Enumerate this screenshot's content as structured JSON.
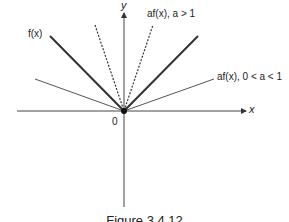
{
  "diagram": {
    "axes": {
      "x_label": "x",
      "y_label": "y",
      "origin_label": "0"
    },
    "curves": [
      {
        "label": "f(x)",
        "style": "solid-thick",
        "slope": 1
      },
      {
        "label": "af(x), a > 1",
        "style": "dashed",
        "slope": 3.5
      },
      {
        "label": "af(x), 0 < a < 1",
        "style": "solid-thin",
        "slope": 0.27
      }
    ],
    "caption": "Figure 3.4.12"
  },
  "colors": {
    "line": "#333333",
    "thin_line": "#555555",
    "background": "#ffffff"
  }
}
